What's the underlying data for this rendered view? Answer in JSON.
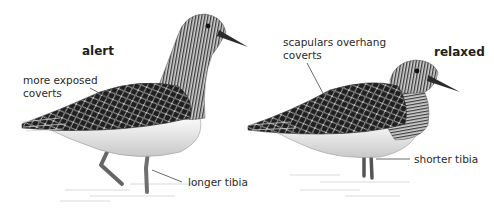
{
  "figure": {
    "birds": [
      {
        "id": "alert",
        "title": "alert",
        "annotations": [
          {
            "id": "coverts",
            "lines": [
              "more exposed",
              "coverts"
            ]
          },
          {
            "id": "tibia",
            "lines": [
              "longer tibia"
            ]
          }
        ]
      },
      {
        "id": "relaxed",
        "title": "relaxed",
        "annotations": [
          {
            "id": "scapulars",
            "lines": [
              "scapulars overhang",
              "coverts"
            ]
          },
          {
            "id": "tibia",
            "lines": [
              "shorter tibia"
            ]
          }
        ]
      }
    ],
    "colors": {
      "background": "#ffffff",
      "text": "#2a2a2a",
      "leader_line": "#444444",
      "plumage_dark": "#2b2b2b",
      "plumage_mid": "#8a8a8a",
      "belly": "#f2f2f2",
      "legs": "#777777",
      "water": "#d8dde0"
    }
  }
}
